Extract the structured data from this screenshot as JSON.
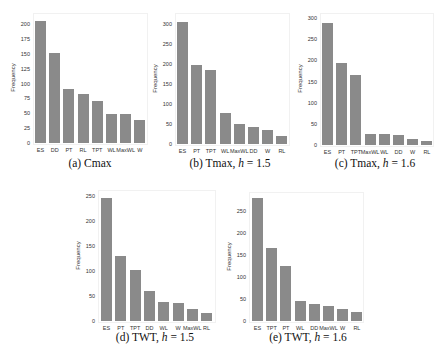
{
  "chart_data": [
    {
      "id": "a",
      "type": "bar",
      "title": "",
      "caption": "(a) Cmax",
      "xlabel": "",
      "ylabel": "Frequency",
      "categories": [
        "ES",
        "DD",
        "PT",
        "RL",
        "TPT",
        "WL",
        "MaxWL",
        "W"
      ],
      "values": [
        205,
        151,
        90,
        82,
        70,
        49,
        48,
        38
      ],
      "yticks": [
        0,
        25,
        50,
        75,
        100,
        125,
        150,
        175,
        200
      ],
      "ylim": [
        0,
        210
      ],
      "grid": false,
      "legend": null,
      "layout": {
        "left": 33,
        "top": 13,
        "right": 148,
        "zeroY": 143,
        "topTickY": 24,
        "topTickVal": 200,
        "firstBarX": 35,
        "barW": 11,
        "barStep": 14.2
      }
    },
    {
      "id": "b",
      "type": "bar",
      "title": "",
      "caption_prefix": "(b) Tmax, ",
      "caption_var": "h",
      "caption_suffix": " = 1.5",
      "xlabel": "",
      "ylabel": "Frequency",
      "categories": [
        "ES",
        "PT",
        "TPT",
        "WL",
        "MaxWL",
        "DD",
        "W",
        "RL"
      ],
      "values": [
        306,
        198,
        185,
        77,
        49,
        42,
        34,
        20
      ],
      "yticks": [
        0,
        50,
        100,
        150,
        200,
        250,
        300
      ],
      "ylim": [
        0,
        315
      ],
      "grid": false,
      "legend": null,
      "layout": {
        "left": 175,
        "top": 13,
        "right": 290,
        "zeroY": 144,
        "topTickY": 24,
        "topTickVal": 300,
        "firstBarX": 177,
        "barW": 11,
        "barStep": 14.2
      }
    },
    {
      "id": "c",
      "type": "bar",
      "title": "",
      "caption_prefix": "(c) Tmax, ",
      "caption_var": "h",
      "caption_suffix": " = 1.6",
      "xlabel": "",
      "ylabel": "Frequency",
      "categories": [
        "ES",
        "PT",
        "TPT",
        "MaxWL",
        "WL",
        "DD",
        "W",
        "RL"
      ],
      "values": [
        288,
        194,
        165,
        27,
        26,
        24,
        14,
        10
      ],
      "yticks": [
        0,
        50,
        100,
        150,
        200,
        250,
        300
      ],
      "ylim": [
        0,
        305
      ],
      "grid": false,
      "legend": null,
      "layout": {
        "left": 320,
        "top": 13,
        "right": 434,
        "zeroY": 145,
        "topTickY": 18,
        "topTickVal": 300,
        "firstBarX": 322,
        "barW": 11,
        "barStep": 14.2
      }
    },
    {
      "id": "d",
      "type": "bar",
      "title": "",
      "caption_prefix": "(d) TWT, ",
      "caption_var": "h",
      "caption_suffix": " = 1.5",
      "xlabel": "",
      "ylabel": "Frequency",
      "categories": [
        "ES",
        "PT",
        "TPT",
        "DD",
        "WL",
        "W",
        "MaxWL",
        "RL"
      ],
      "values": [
        246,
        130,
        103,
        60,
        38,
        36,
        25,
        17
      ],
      "yticks": [
        0,
        50,
        100,
        150,
        200,
        250
      ],
      "ylim": [
        0,
        255
      ],
      "grid": false,
      "legend": null,
      "layout": {
        "left": 98,
        "top": 190,
        "right": 216,
        "zeroY": 321,
        "topTickY": 196,
        "topTickVal": 250,
        "firstBarX": 101,
        "barW": 11,
        "barStep": 14.3
      }
    },
    {
      "id": "e",
      "type": "bar",
      "title": "",
      "caption_prefix": "(e) TWT, ",
      "caption_var": "h",
      "caption_suffix": " = 1.6",
      "xlabel": "",
      "ylabel": "Frequency",
      "categories": [
        "ES",
        "TPT",
        "PT",
        "WL",
        "DD",
        "MaxWL",
        "W",
        "RL"
      ],
      "values": [
        280,
        166,
        126,
        45,
        39,
        33,
        28,
        21
      ],
      "yticks": [
        0,
        50,
        100,
        150,
        200,
        250
      ],
      "ylim": [
        0,
        290
      ],
      "grid": false,
      "legend": null,
      "layout": {
        "left": 249,
        "top": 192,
        "right": 364,
        "zeroY": 321,
        "topTickY": 211,
        "topTickVal": 250,
        "firstBarX": 252,
        "barW": 11,
        "barStep": 14.2
      }
    }
  ],
  "colors": {
    "bar": "#8a8a8a",
    "axes_border": "#f1f1f1",
    "text": "#333333"
  },
  "captions": {
    "a": "(a) Cmax",
    "b_prefix": "(b) Tmax, ",
    "b_var": "h",
    "b_suffix": " = 1.5",
    "c_prefix": "(c) Tmax, ",
    "c_var": "h",
    "c_suffix": " = 1.6",
    "d_prefix": "(d) TWT, ",
    "d_var": "h",
    "d_suffix": " = 1.5",
    "e_prefix": "(e) TWT, ",
    "e_var": "h",
    "e_suffix": " = 1.6"
  }
}
